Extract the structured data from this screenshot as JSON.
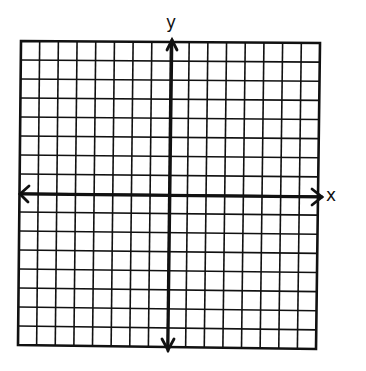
{
  "diagram": {
    "type": "coordinate-grid",
    "grid": {
      "columns": 16,
      "rows": 16,
      "columns_left_of_y_axis": 8,
      "columns_right_of_y_axis": 8,
      "rows_above_x_axis": 8,
      "rows_below_x_axis": 8,
      "gridlines": true
    },
    "axes": {
      "x": {
        "label": "x",
        "arrows": "both"
      },
      "y": {
        "label": "y",
        "arrows": "both"
      }
    },
    "tick_labels": [],
    "plotted_points": [],
    "colors": {
      "ink": "#111111",
      "background": "#ffffff"
    }
  }
}
